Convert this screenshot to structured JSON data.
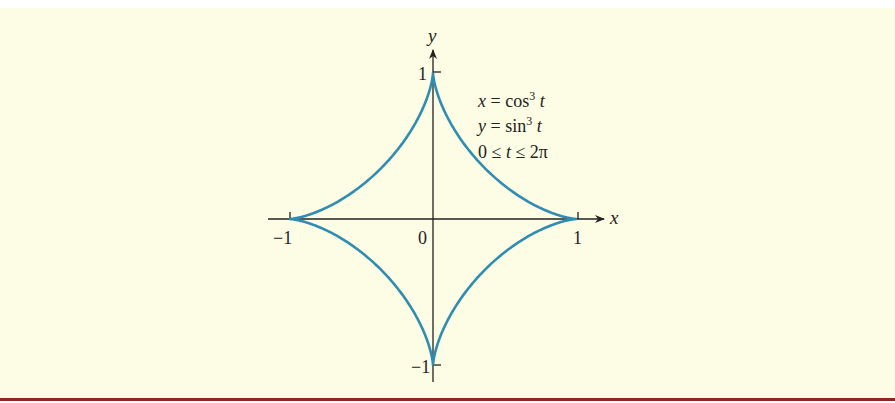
{
  "chart_data": {
    "type": "line",
    "title": "",
    "curve_name": "astroid",
    "equations": [
      "x = cos³ t",
      "y = sin³ t",
      "0 ≤ t ≤ 2π"
    ],
    "parametric": {
      "x": "cos^3 t",
      "y": "sin^3 t",
      "t_range": [
        0,
        6.283185307
      ]
    },
    "xlabel": "x",
    "ylabel": "y",
    "xlim": [
      -1,
      1
    ],
    "ylim": [
      -1,
      1
    ],
    "x_ticks": [
      {
        "value": -1,
        "label": "−1"
      },
      {
        "value": 1,
        "label": "1"
      }
    ],
    "y_ticks": [
      {
        "value": 1,
        "label": "1"
      },
      {
        "value": -1,
        "label": "−1"
      }
    ],
    "origin_label": "0",
    "grid": false,
    "series": [
      {
        "name": "astroid",
        "color": "#2e8db0",
        "x": [
          1,
          0.65,
          0.35,
          0.125,
          0.02,
          0,
          -0.02,
          -0.125,
          -0.35,
          -0.65,
          -1,
          -0.65,
          -0.35,
          -0.125,
          -0.02,
          0,
          0.02,
          0.125,
          0.35,
          0.65,
          1
        ],
        "y": [
          0,
          0.02,
          0.125,
          0.35,
          0.65,
          1,
          0.65,
          0.35,
          0.125,
          0.02,
          0,
          -0.02,
          -0.125,
          -0.35,
          -0.65,
          -1,
          -0.65,
          -0.35,
          -0.125,
          -0.02,
          0
        ]
      }
    ]
  },
  "colors": {
    "background": "#fdfce4",
    "curve": "#2e8db0",
    "axes": "#222222",
    "bottom_rule": "#8a2a22"
  },
  "labels": {
    "y_axis": "y",
    "x_axis": "x",
    "origin": "0",
    "y_pos": "1",
    "y_neg": "−1",
    "x_pos": "1",
    "x_neg": "−1",
    "eq1_lhs": "x = cos",
    "eq1_sup": "3",
    "eq1_var": " t",
    "eq2_lhs": "y = sin",
    "eq2_sup": "3",
    "eq2_var": " t",
    "eq3": "0 ≤ t ≤ 2π"
  }
}
